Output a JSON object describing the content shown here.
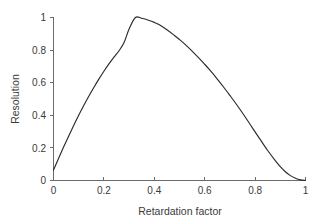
{
  "chart_data": {
    "type": "line",
    "title": "",
    "subtitle": "",
    "xlabel": "Retardation factor",
    "ylabel": "Resolution",
    "xlim": [
      0,
      1
    ],
    "ylim": [
      0,
      1
    ],
    "xticks": [
      "0",
      "0.2",
      "0.4",
      "0.6",
      "0.8",
      "1"
    ],
    "xtick_values": [
      0,
      0.2,
      0.4,
      0.6,
      0.8,
      1
    ],
    "yticks": [
      "0",
      "0.2",
      "0.4",
      "0.6",
      "0.8",
      "1"
    ],
    "ytick_values": [
      0,
      0.2,
      0.4,
      0.6,
      0.8,
      1
    ],
    "grid": false,
    "legend": false,
    "legend_position": "none",
    "annotations": [],
    "series": [
      {
        "name": "Resolution vs retardation factor",
        "color": "#2b2b2b",
        "x": [
          0.0,
          0.02,
          0.04,
          0.06,
          0.08,
          0.1,
          0.12,
          0.14,
          0.16,
          0.18,
          0.2,
          0.22,
          0.24,
          0.26,
          0.28,
          0.3,
          0.325,
          0.35,
          0.38,
          0.4,
          0.42,
          0.45,
          0.48,
          0.5,
          0.52,
          0.55,
          0.58,
          0.6,
          0.62,
          0.65,
          0.68,
          0.7,
          0.72,
          0.75,
          0.78,
          0.8,
          0.82,
          0.85,
          0.88,
          0.9,
          0.92,
          0.94,
          0.96,
          0.98,
          1.0
        ],
        "y": [
          0.065,
          0.135,
          0.205,
          0.272,
          0.337,
          0.4,
          0.46,
          0.517,
          0.571,
          0.622,
          0.67,
          0.715,
          0.757,
          0.796,
          0.846,
          0.93,
          1.0,
          0.995,
          0.982,
          0.97,
          0.955,
          0.925,
          0.89,
          0.865,
          0.838,
          0.794,
          0.746,
          0.713,
          0.678,
          0.622,
          0.563,
          0.522,
          0.48,
          0.414,
          0.345,
          0.298,
          0.252,
          0.184,
          0.122,
          0.085,
          0.054,
          0.03,
          0.014,
          0.004,
          0.0
        ]
      }
    ]
  },
  "axes": {
    "ylabel": "Resolution",
    "xlabel": "Retardation factor",
    "ytick_labels": [
      "1",
      "0.8",
      "0.6",
      "0.4",
      "0.2",
      "0"
    ],
    "xtick_labels": [
      "0",
      "0.2",
      "0.4",
      "0.6",
      "0.8",
      "1"
    ]
  },
  "colors": {
    "curve": "#2b2b2b",
    "axis": "#6b6b6b",
    "text": "#3a3a3a",
    "background": "#ffffff"
  }
}
